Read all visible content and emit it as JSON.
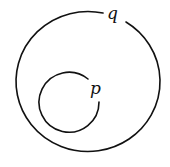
{
  "diagram": {
    "type": "nested-curves",
    "stroke_color": "#111111",
    "background": "#ffffff",
    "outer_curve": {
      "label": "q",
      "shape": "circle-with-gap-at-label"
    },
    "inner_curve": {
      "label": "p",
      "shape": "open-arc-with-gap-at-label"
    }
  }
}
